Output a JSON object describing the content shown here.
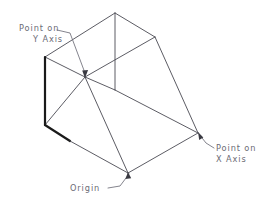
{
  "diagram": {
    "background_color": "#ffffff",
    "edge_color": "#4a4a52",
    "bold_edge_color": "#1a1a1a",
    "leader_color": "#6e6e78",
    "label_color": "#6b6b75",
    "width": 274,
    "height": 209
  },
  "labels": {
    "y_axis": {
      "line1": "Point on",
      "line2": "Y Axis",
      "name": "point-on-y-axis"
    },
    "x_axis": {
      "line1": "Point on",
      "line2": "X Axis",
      "name": "point-on-x-axis"
    },
    "origin": {
      "line1": "Origin",
      "name": "origin"
    }
  },
  "vertices": {
    "top_apex": [
      115,
      13
    ],
    "top_right": [
      155,
      37
    ],
    "top_left": [
      45,
      57
    ],
    "top_front": [
      85,
      77
    ],
    "mid_center": [
      115,
      90
    ],
    "left_bottom": [
      45,
      125
    ],
    "origin_point": [
      128,
      173
    ],
    "x_point": [
      198,
      133
    ]
  },
  "leaders": {
    "y_axis_target": [
      85,
      77
    ],
    "x_axis_target": [
      198,
      133
    ],
    "origin_target": [
      128,
      173
    ]
  }
}
